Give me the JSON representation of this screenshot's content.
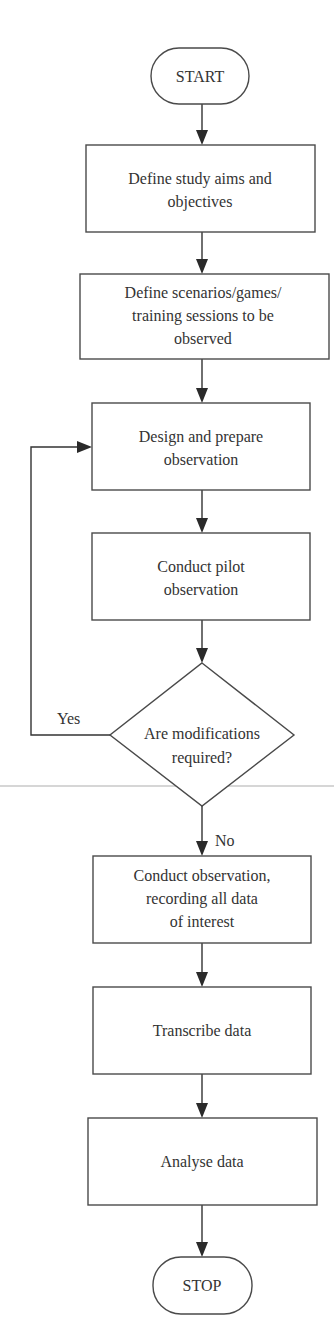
{
  "diagram": {
    "type": "flowchart",
    "colors": {
      "stroke": "#4a4a4a",
      "connector": "#333333",
      "arrowhead": "#2a2a2a",
      "text": "#333333",
      "background": "#ffffff"
    },
    "nodes": [
      {
        "id": "start",
        "shape": "terminal",
        "lines": [
          "START"
        ]
      },
      {
        "id": "define-aims",
        "shape": "process",
        "lines": [
          "Define study aims and",
          "objectives"
        ]
      },
      {
        "id": "define-scenarios",
        "shape": "process",
        "lines": [
          "Define scenarios/games/",
          "training sessions to be",
          "observed"
        ]
      },
      {
        "id": "design-prepare",
        "shape": "process",
        "lines": [
          "Design and prepare",
          "observation"
        ]
      },
      {
        "id": "pilot",
        "shape": "process",
        "lines": [
          "Conduct pilot",
          "observation"
        ]
      },
      {
        "id": "decision",
        "shape": "decision",
        "lines": [
          "Are modifications",
          "required?"
        ]
      },
      {
        "id": "conduct",
        "shape": "process",
        "lines": [
          "Conduct observation,",
          "recording all data",
          "of interest"
        ]
      },
      {
        "id": "transcribe",
        "shape": "process",
        "lines": [
          "Transcribe data"
        ]
      },
      {
        "id": "analyse",
        "shape": "process",
        "lines": [
          "Analyse data"
        ]
      },
      {
        "id": "stop",
        "shape": "terminal",
        "lines": [
          "STOP"
        ]
      }
    ],
    "edges": [
      {
        "from": "start",
        "to": "define-aims",
        "label": ""
      },
      {
        "from": "define-aims",
        "to": "define-scenarios",
        "label": ""
      },
      {
        "from": "define-scenarios",
        "to": "design-prepare",
        "label": ""
      },
      {
        "from": "design-prepare",
        "to": "pilot",
        "label": ""
      },
      {
        "from": "pilot",
        "to": "decision",
        "label": ""
      },
      {
        "from": "decision",
        "to": "design-prepare",
        "label": "Yes"
      },
      {
        "from": "decision",
        "to": "conduct",
        "label": "No"
      },
      {
        "from": "conduct",
        "to": "transcribe",
        "label": ""
      },
      {
        "from": "transcribe",
        "to": "analyse",
        "label": ""
      },
      {
        "from": "analyse",
        "to": "stop",
        "label": ""
      }
    ],
    "labels": {
      "yes": "Yes",
      "no": "No"
    }
  }
}
